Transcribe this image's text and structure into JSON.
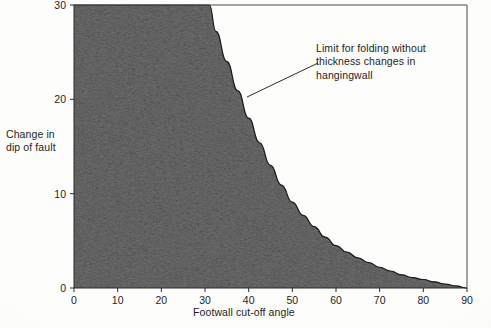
{
  "figure": {
    "background_color": "#fdfdfc",
    "ink_color": "#1d1d1d",
    "shading_color": "#2a2a2a"
  },
  "annotation": {
    "text": "Limit for folding without\nthickness changes in\nhangingwall",
    "leader_from_x": 318,
    "leader_from_y": 63,
    "leader_to_x": 247,
    "leader_to_y": 97
  },
  "chart_data": {
    "type": "line",
    "title": "",
    "xlabel": "Footwall cut-off angle",
    "ylabel": "Change in\ndip of fault",
    "xlim": [
      0,
      90
    ],
    "ylim": [
      0,
      30
    ],
    "xticks": [
      0,
      10,
      20,
      30,
      40,
      50,
      60,
      70,
      80,
      90
    ],
    "yticks": [
      0,
      10,
      20,
      30
    ],
    "xtick_labels": [
      "0",
      "10",
      "20",
      "30",
      "40",
      "50",
      "60",
      "70",
      "80",
      "90"
    ],
    "ytick_labels": [
      "0",
      "10",
      "20",
      "30"
    ],
    "grid": false,
    "legend": "none",
    "series": [
      {
        "name": "Limit for folding without thickness changes in hangingwall",
        "fill_below": true,
        "fill_style": "dark-stipple",
        "x": [
          0,
          5,
          10,
          15,
          20,
          25,
          30,
          31,
          32.5,
          35,
          37.5,
          40,
          42.5,
          45,
          47.5,
          50,
          52.5,
          55,
          57.5,
          60,
          62.5,
          65,
          67.5,
          70,
          72.5,
          75,
          77.5,
          80,
          82.5,
          85,
          87.5,
          90
        ],
        "y": [
          30,
          30,
          30,
          30,
          30,
          30,
          30,
          30,
          27.2,
          24.0,
          20.9,
          18.0,
          15.4,
          13.0,
          10.9,
          9.1,
          7.7,
          6.5,
          5.4,
          4.5,
          3.8,
          3.2,
          2.7,
          2.2,
          1.8,
          1.4,
          1.1,
          0.9,
          0.65,
          0.42,
          0.22,
          0.0
        ]
      }
    ],
    "clipped_note": "Curve exceeds the top of the plot for x below about 31 degrees"
  },
  "axes": {
    "plot_left_px": 74,
    "plot_right_px": 467,
    "plot_top_px": 5,
    "plot_bottom_px": 288
  }
}
